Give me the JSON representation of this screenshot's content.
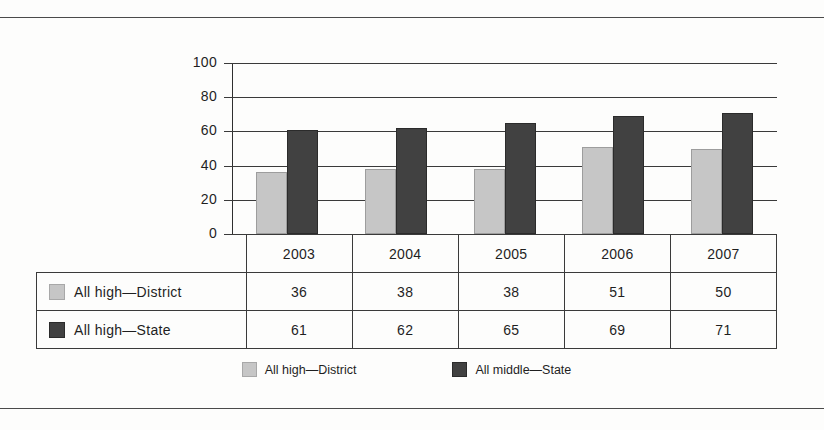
{
  "figure": {
    "clipped_caption_text": "",
    "frame_rule_color": "#4a4a4a"
  },
  "colors": {
    "district": "#c6c6c6",
    "state": "#414141",
    "axis": "#3a3a3a",
    "text": "#1f1f1f"
  },
  "chart_data": {
    "type": "bar",
    "title": "",
    "xlabel": "",
    "ylabel": "",
    "ylim": [
      0,
      100
    ],
    "yticks": [
      0,
      20,
      40,
      60,
      80,
      100
    ],
    "grid": true,
    "legend_position": "bottom",
    "categories": [
      "2003",
      "2004",
      "2005",
      "2006",
      "2007"
    ],
    "series": [
      {
        "name": "All high—District",
        "values": [
          36,
          38,
          38,
          51,
          50
        ],
        "color": "#c6c6c6"
      },
      {
        "name": "All high—State",
        "values": [
          61,
          62,
          65,
          69,
          71
        ],
        "color": "#414141"
      }
    ],
    "legend_entries": [
      "All high—District",
      "All middle—State"
    ]
  },
  "table": {
    "header": [
      "",
      "2003",
      "2004",
      "2005",
      "2006",
      "2007"
    ],
    "rows": [
      {
        "label": "All high—District",
        "swatch": "district",
        "values": [
          "36",
          "38",
          "38",
          "51",
          "50"
        ]
      },
      {
        "label": "All high—State",
        "swatch": "state",
        "values": [
          "61",
          "62",
          "65",
          "69",
          "71"
        ]
      }
    ]
  },
  "legend": {
    "items": [
      {
        "label": "All high—District",
        "swatch": "district"
      },
      {
        "label": "All middle—State",
        "swatch": "state"
      }
    ]
  }
}
